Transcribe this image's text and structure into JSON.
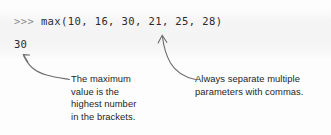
{
  "figure": {
    "kind": "python-console-annotated-diagram",
    "background_color": "#fdfdfd",
    "text_color": "#1d1d1d",
    "arrow_color": "#6f6f6f"
  },
  "console": {
    "prompt": ">>> ",
    "command": "max(10, 16, 30, 21, 25, 28)",
    "full_input_line": ">>> max(10, 16, 30, 21, 25, 28)",
    "output": "30",
    "function_name": "max",
    "arguments": [
      10,
      16,
      30,
      21,
      25,
      28
    ],
    "prompt_color": "#8b8b8b",
    "code_color": "#2b2b2b"
  },
  "annotations": {
    "left": {
      "target": "output-line",
      "lines": [
        "The maximum",
        "value is the",
        "highest number",
        "in the brackets."
      ],
      "full_text": "The maximum value is the highest number in the brackets."
    },
    "right": {
      "target": "argument-separator-comma",
      "lines": [
        "Always separate multiple",
        "parameters with commas."
      ],
      "full_text": "Always separate multiple parameters with commas."
    }
  }
}
